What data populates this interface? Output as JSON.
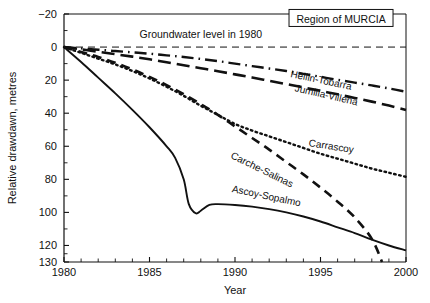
{
  "chart_data": {
    "type": "line",
    "title": "Region of MURCIA",
    "xlabel": "Year",
    "ylabel": "Relative drawdawn, metres",
    "xlim": [
      1980,
      2000
    ],
    "ylim": [
      -20,
      130
    ],
    "y_inverted": true,
    "grid": false,
    "legend_position": "inline-series-labels",
    "xticks": [
      1980,
      1985,
      1990,
      1995,
      2000
    ],
    "xticklabels": [
      "1980",
      "1985",
      "1990",
      "1995",
      "2000"
    ],
    "x_minor_tick_step": 1,
    "yticks": [
      -20,
      0,
      20,
      40,
      60,
      80,
      100,
      120,
      130
    ],
    "yticklabels": [
      "−20",
      "0",
      "20",
      "40",
      "60",
      "80",
      "100",
      "120",
      "130"
    ],
    "y_minor_ticks": [
      -10,
      10,
      30,
      50,
      70,
      90,
      110,
      125
    ],
    "annotations": [
      {
        "text": "Groundwater level in 1980",
        "x": 1988.0,
        "y": -5.5
      },
      {
        "text": "Region of MURCIA",
        "x": 1996.2,
        "y": -17.0,
        "boxed": true
      }
    ],
    "reference_line": {
      "label": "Groundwater level in 1980",
      "y": 0,
      "style": "dashed"
    },
    "series": [
      {
        "name": "Hellin-Tobarra",
        "style": "dash-dot",
        "label_x": 1995.0,
        "label_y": 22.0,
        "label_rotation": 12,
        "x": [
          1980,
          1981,
          1982,
          1983,
          1984,
          1985,
          1986,
          1987,
          1988,
          1989,
          1990,
          1991,
          1992,
          1993,
          1994,
          1995,
          1996,
          1997,
          1998,
          1999,
          2000
        ],
        "y": [
          0,
          0.8,
          1.6,
          2.4,
          3.2,
          4.0,
          5.0,
          6.0,
          7.2,
          8.5,
          10.0,
          11.5,
          13.0,
          14.5,
          16.2,
          18.0,
          19.8,
          21.5,
          23.2,
          25.0,
          27.0
        ]
      },
      {
        "name": "Jumilla-Villena",
        "style": "dashed-long",
        "label_x": 1995.3,
        "label_y": 31.0,
        "label_rotation": 13,
        "x": [
          1980,
          1981,
          1982,
          1983,
          1984,
          1985,
          1986,
          1987,
          1988,
          1989,
          1990,
          1991,
          1992,
          1993,
          1994,
          1995,
          1996,
          1997,
          1998,
          1999,
          2000
        ],
        "y": [
          0,
          1.4,
          2.8,
          4.3,
          5.8,
          7.4,
          9.2,
          11.0,
          12.8,
          14.6,
          16.5,
          18.4,
          20.4,
          22.4,
          24.4,
          26.5,
          28.6,
          30.8,
          33.0,
          35.4,
          38.0
        ]
      },
      {
        "name": "Carrascoy",
        "style": "dotted",
        "label_x": 1995.6,
        "label_y": 62.0,
        "label_rotation": 9,
        "x": [
          1980,
          1981,
          1982,
          1983,
          1984,
          1985,
          1986,
          1987,
          1988,
          1989,
          1990,
          1991,
          1992,
          1993,
          1994,
          1995,
          1996,
          1997,
          1998,
          1999,
          2000
        ],
        "y": [
          0,
          3.5,
          7.0,
          10.5,
          14.5,
          19.0,
          24.0,
          29.5,
          35.5,
          41.0,
          46.5,
          50.5,
          54.0,
          57.5,
          61.0,
          64.5,
          67.5,
          70.5,
          73.5,
          76.0,
          78.5
        ]
      },
      {
        "name": "Carche-Salinas",
        "style": "dashed-medium",
        "label_x": 1991.5,
        "label_y": 76.0,
        "label_rotation": 26,
        "x": [
          1980,
          1981,
          1982,
          1983,
          1984,
          1985,
          1986,
          1987,
          1988,
          1989,
          1990,
          1991,
          1992,
          1993,
          1994,
          1995,
          1996,
          1997,
          1998,
          1998.6
        ],
        "y": [
          0,
          3.0,
          6.0,
          9.5,
          13.5,
          18.0,
          23.0,
          28.5,
          34.5,
          41.0,
          48.0,
          55.0,
          62.0,
          69.5,
          77.0,
          85.0,
          93.5,
          103.0,
          116.0,
          130.0
        ]
      },
      {
        "name": "Ascoy-Sopalmo",
        "style": "solid",
        "label_x": 1991.8,
        "label_y": 92.0,
        "label_rotation": 12,
        "x": [
          1980,
          1981,
          1982,
          1983,
          1984,
          1985,
          1986,
          1986.5,
          1987,
          1987.3,
          1987.7,
          1988,
          1988.5,
          1989,
          1990,
          1991,
          1992,
          1993,
          1994,
          1995,
          1996,
          1997,
          1998,
          1999,
          2000
        ],
        "y": [
          0,
          9.0,
          18.5,
          28.0,
          38.0,
          48.5,
          60.0,
          67.0,
          80.0,
          95.0,
          100.5,
          99.0,
          95.5,
          95.0,
          95.5,
          96.5,
          98.0,
          100.0,
          102.5,
          105.5,
          109.0,
          112.5,
          116.5,
          120.0,
          123.0
        ]
      }
    ]
  }
}
